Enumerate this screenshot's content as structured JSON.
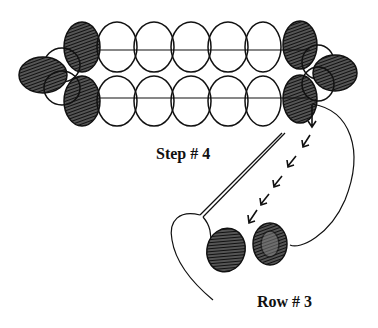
{
  "diagram": {
    "labels": {
      "step": "Step # 4",
      "row": "Row # 3"
    },
    "colors": {
      "line": "#111111",
      "shaded_bead": "#222222",
      "background": "#ffffff"
    },
    "bead_strip": {
      "top_row_beads": 7,
      "bottom_row_beads": 7,
      "left_end_bead": "shaded",
      "right_end_bead": "shaded"
    },
    "row3_beads": 2,
    "arrow_count": 6
  }
}
